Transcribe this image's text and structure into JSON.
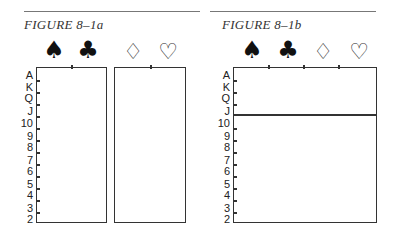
{
  "figures": [
    {
      "caption": "FIGURE 8–1a",
      "suits": [
        {
          "name": "spades",
          "glyph": "♠"
        },
        {
          "name": "clubs",
          "glyph": "♣"
        },
        {
          "name": "diamonds",
          "glyph": "♢"
        },
        {
          "name": "hearts",
          "glyph": "♡"
        }
      ],
      "ranks": [
        "A",
        "K",
        "Q",
        "J",
        "10",
        "9",
        "8",
        "7",
        "6",
        "5",
        "4",
        "3",
        "2"
      ],
      "layout": "two-boxes: black suits | red suits"
    },
    {
      "caption": "FIGURE 8–1b",
      "suits": [
        {
          "name": "spades",
          "glyph": "♠"
        },
        {
          "name": "clubs",
          "glyph": "♣"
        },
        {
          "name": "diamonds",
          "glyph": "♢"
        },
        {
          "name": "hearts",
          "glyph": "♡"
        }
      ],
      "ranks": [
        "A",
        "K",
        "Q",
        "J",
        "10",
        "9",
        "8",
        "7",
        "6",
        "5",
        "4",
        "3",
        "2"
      ],
      "layout": "single box divided between J and 10"
    }
  ],
  "colors": {
    "line": "#333333",
    "rule": "#777777",
    "text": "#222222"
  }
}
